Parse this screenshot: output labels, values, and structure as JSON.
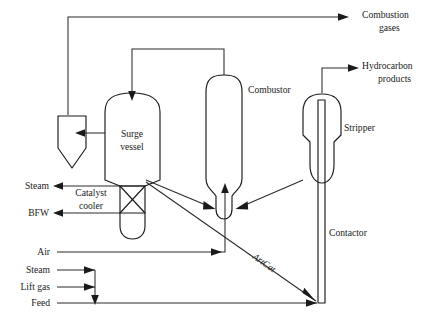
{
  "diagram": {
    "type": "process-flow-diagram",
    "stroke_color": "#1a1a1a",
    "background_color": "#ffffff"
  },
  "equipment": [
    {
      "id": "separator",
      "label": ""
    },
    {
      "id": "surge-vessel",
      "label": "Surge\nvessel",
      "line1": "Surge",
      "line2": "vessel"
    },
    {
      "id": "catalyst-cooler",
      "label": "Catalyst\ncooler",
      "line1": "Catalyst",
      "line2": "cooler"
    },
    {
      "id": "combustor",
      "label": "Combustor"
    },
    {
      "id": "stripper",
      "label": "Stripper"
    },
    {
      "id": "contactor",
      "label": "Contactor"
    }
  ],
  "labels": {
    "combustion_gases_line1": "Combustion",
    "combustion_gases_line2": "gases",
    "hydrocarbon_products_line1": "Hydrocarbon",
    "hydrocarbon_products_line2": "products",
    "combustor": "Combustor",
    "stripper": "Stripper",
    "contactor": "Contactor",
    "surge_vessel_line1": "Surge",
    "surge_vessel_line2": "vessel",
    "catalyst_cooler_line1": "Catalyst",
    "catalyst_cooler_line2": "cooler",
    "steam_top": "Steam",
    "bfw": "BFW",
    "air": "Air",
    "steam_bottom": "Steam",
    "lift_gas": "Lift gas",
    "feed": "Feed",
    "artcat": "ArtCat"
  },
  "streams": [
    {
      "name": "combustion-gases",
      "label": "Combustion gases",
      "direction": "out"
    },
    {
      "name": "hydrocarbon-products",
      "label": "Hydrocarbon products",
      "direction": "out"
    },
    {
      "name": "steam-out",
      "label": "Steam",
      "direction": "out"
    },
    {
      "name": "bfw-in",
      "label": "BFW",
      "direction": "out"
    },
    {
      "name": "air-in",
      "label": "Air",
      "direction": "in"
    },
    {
      "name": "steam-in",
      "label": "Steam",
      "direction": "in"
    },
    {
      "name": "lift-gas-in",
      "label": "Lift gas",
      "direction": "in"
    },
    {
      "name": "feed-in",
      "label": "Feed",
      "direction": "in"
    },
    {
      "name": "artcat",
      "label": "ArtCat",
      "direction": "internal"
    }
  ]
}
